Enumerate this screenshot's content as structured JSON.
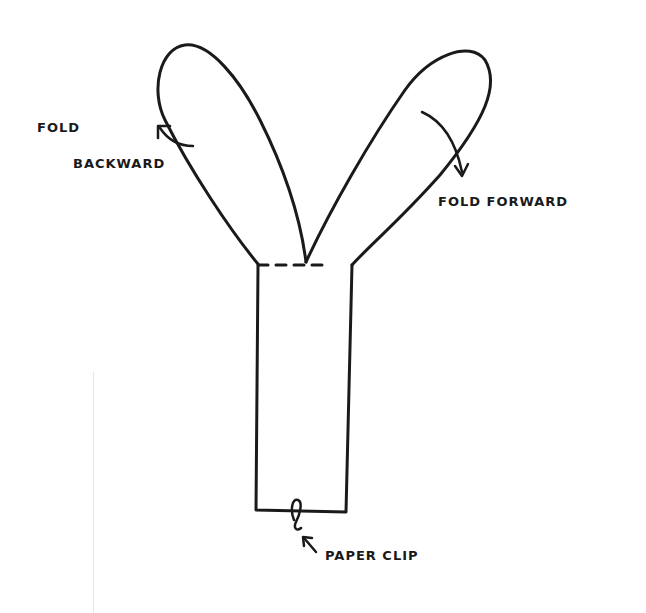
{
  "diagram": {
    "stroke_color": "#1a1a1a",
    "background": "#ffffff",
    "labels": {
      "fold_backward_line1": "FOLD",
      "fold_backward_line2": "BACKWARD",
      "fold_forward": "FOLD FORWARD",
      "paper_clip": "PAPER CLIP"
    },
    "parts": {
      "left_wing": "wing folded backward",
      "right_wing": "wing folded forward",
      "stem": "body",
      "clip": "paper clip at bottom"
    }
  }
}
